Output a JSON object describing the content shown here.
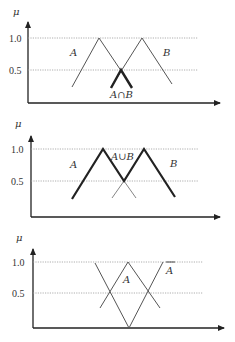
{
  "panels": [
    {
      "name": "intersection",
      "y_axis_label": "μ",
      "tick_1": "1.0",
      "tick_05": "0.5",
      "set_a_label": "A",
      "set_b_label": "B",
      "result_label": "A∩B"
    },
    {
      "name": "union",
      "y_axis_label": "μ",
      "tick_1": "1.0",
      "tick_05": "0.5",
      "set_a_label": "A",
      "set_b_label": "B",
      "result_label": "A∪B"
    },
    {
      "name": "complement",
      "y_axis_label": "μ",
      "tick_1": "1.0",
      "tick_05": "0.5",
      "set_a_label": "A",
      "complement_label": "A"
    }
  ],
  "colors": {
    "axis": "#333333",
    "grid": "#888888",
    "thin_line": "#555555",
    "bold_line": "#222222"
  }
}
